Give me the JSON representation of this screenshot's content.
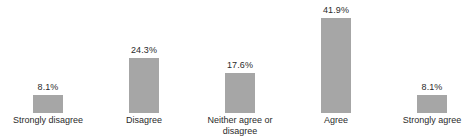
{
  "chart_data": {
    "type": "bar",
    "title": "",
    "subtitle": "",
    "xlabel": "",
    "ylabel": "",
    "categories": [
      "Strongly disagree",
      "Disagree",
      "Neither agree or\ndisagree",
      "Agree",
      "Strongly agree"
    ],
    "values": [
      8.1,
      24.3,
      17.6,
      41.9,
      8.1
    ],
    "data_labels": [
      "8.1%",
      "24.3%",
      "17.6%",
      "41.9%",
      "8.1%"
    ],
    "ylim": [
      0,
      41.9
    ],
    "grid": false,
    "legend": "none",
    "axis_lines": false,
    "bar_color": "#a6a6a6",
    "text_color": "#2b2b2b",
    "background_color": "#ffffff",
    "units": "percent"
  },
  "bars": [
    {
      "category": "Strongly disagree",
      "value": 8.1,
      "label": "8.1%",
      "height_px": 18
    },
    {
      "category": "Disagree",
      "value": 24.3,
      "label": "24.3%",
      "height_px": 55
    },
    {
      "category": "Neither agree or\ndisagree",
      "value": 17.6,
      "label": "17.6%",
      "height_px": 40
    },
    {
      "category": "Agree",
      "value": 41.9,
      "label": "41.9%",
      "height_px": 95
    },
    {
      "category": "Strongly agree",
      "value": 8.1,
      "label": "8.1%",
      "height_px": 18
    }
  ]
}
